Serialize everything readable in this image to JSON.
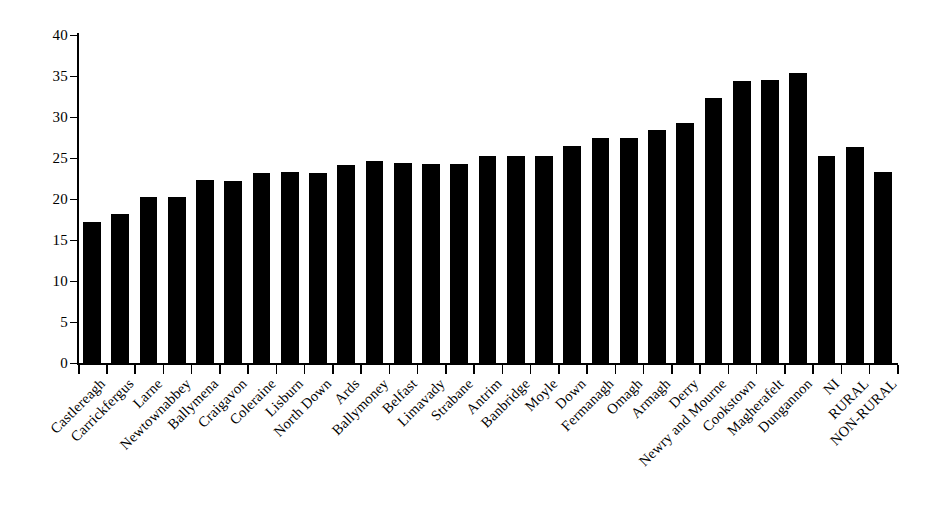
{
  "chart_data": {
    "type": "bar",
    "title": "",
    "subtitle": "",
    "xlabel": "",
    "ylabel": "",
    "ylim": [
      0,
      40
    ],
    "ytick_step": 5,
    "yticks": [
      0,
      5,
      10,
      15,
      20,
      25,
      30,
      35,
      40
    ],
    "grid": false,
    "legend": false,
    "legend_position": "none",
    "bar_color": "#000000",
    "orientation": "vertical",
    "categories": [
      "Castlereagh",
      "Carrickfergus",
      "Larne",
      "Newtownabbey",
      "Ballymena",
      "Craigavon",
      "Coleraine",
      "Lisburn",
      "North Down",
      "Ards",
      "Ballymoney",
      "Belfast",
      "Limavady",
      "Strabane",
      "Antrim",
      "Banbridge",
      "Moyle",
      "Down",
      "Fermanagh",
      "Omagh",
      "Armagh",
      "Derry",
      "Newry and Mourne",
      "Cookstown",
      "Magherafelt",
      "Dungannon",
      "NI",
      "RURAL",
      "NON-RURAL"
    ],
    "values": [
      17.2,
      18.2,
      20.2,
      20.2,
      22.3,
      22.2,
      23.2,
      23.3,
      23.2,
      24.2,
      24.6,
      24.4,
      24.3,
      24.3,
      25.3,
      25.3,
      25.3,
      26.5,
      27.4,
      27.4,
      28.4,
      29.3,
      32.3,
      34.4,
      34.5,
      35.4,
      25.2,
      26.4,
      23.3
    ]
  },
  "axis": {
    "y_tick_labels": [
      "0",
      "5",
      "10",
      "15",
      "20",
      "25",
      "30",
      "35",
      "40"
    ]
  }
}
